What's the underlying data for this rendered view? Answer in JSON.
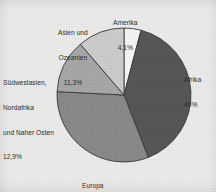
{
  "background_color": "#eeecea",
  "chart_data": {
    "type": "pie",
    "title": "",
    "subtitle": "",
    "xlabel": "",
    "ylabel": "",
    "legend_position": "none",
    "grid": false,
    "labels_placement": "outside-callout",
    "start_angle_deg": 0,
    "direction": "clockwise",
    "center": {
      "x": 124,
      "y": 95
    },
    "radius": 67,
    "categories": [
      "Amerika",
      "Afrika",
      "Europa",
      "Südwestasien, Nordafrika und Naher Osten",
      "Asien und Ozeanien"
    ],
    "values": [
      4.1,
      40.0,
      31.7,
      12.9,
      11.3
    ],
    "value_labels": [
      "4,1%",
      "40%",
      "31,7%",
      "12,9%",
      "11,3%"
    ],
    "unit": "%",
    "total": 100.0,
    "slices": [
      {
        "name": "Amerika",
        "value": 4.1,
        "value_label": "4,1%",
        "color": "#f7f6f4",
        "stroke": "#3a3a3a",
        "label_lines": [
          "Amerika"
        ],
        "label_anchor": "top"
      },
      {
        "name": "Afrika",
        "value": 40.0,
        "value_label": "40%",
        "color": "#575757",
        "stroke": "#3a3a3a",
        "label_lines": [
          "Afrika"
        ],
        "label_anchor": "right"
      },
      {
        "name": "Europa",
        "value": 31.7,
        "value_label": "31,7%",
        "color": "#8a8a8a",
        "stroke": "#3a3a3a",
        "label_lines": [
          "Europa"
        ],
        "label_anchor": "bottom"
      },
      {
        "name": "Südwestasien, Nordafrika und Naher Osten",
        "value": 12.9,
        "value_label": "12,9%",
        "color": "#a8a8a8",
        "stroke": "#3a3a3a",
        "label_lines": [
          "Südwestasien,",
          "Nordafrika",
          "und Naher Osten"
        ],
        "label_anchor": "left"
      },
      {
        "name": "Asien und Ozeanien",
        "value": 11.3,
        "value_label": "11,3%",
        "color": "#cdcdcd",
        "stroke": "#3a3a3a",
        "label_lines": [
          "Asien und",
          "Ozeanien"
        ],
        "label_anchor": "top-left"
      }
    ]
  },
  "labels": {
    "amerika": {
      "line1": "Amerika",
      "pct": "4,1%"
    },
    "asien": {
      "line1": "Asien und",
      "line2": "Ozeanien",
      "pct": "11,3%"
    },
    "suedwest": {
      "line1": "Südwestasien,",
      "line2": "Nordafrika",
      "line3": "und Naher Osten",
      "pct": "12,9%"
    },
    "afrika": {
      "line1": "Afrika",
      "pct": "40%"
    },
    "europa": {
      "line1": "Europa",
      "pct": "31,7%"
    }
  }
}
